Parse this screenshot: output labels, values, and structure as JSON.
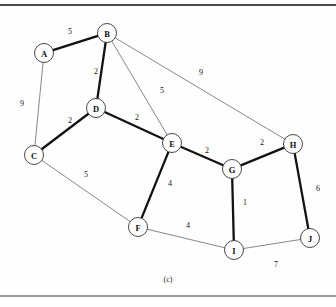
{
  "figure": {
    "caption": "(c)",
    "caption_x": 148,
    "caption_y": 275,
    "colors": {
      "background": "#fefefe",
      "thick_edge": "#121212",
      "thin_edge": "#555555",
      "node_fill": "#ffffff",
      "node_stroke": "#333333",
      "text": "#111111"
    }
  },
  "chart_data": {
    "type": "diagram",
    "subtype": "weighted-undirected-graph",
    "title": "(c)",
    "node_radius": 9.5,
    "nodes": [
      {
        "id": "A",
        "label": "A",
        "x": 44,
        "y": 53
      },
      {
        "id": "B",
        "label": "B",
        "x": 107,
        "y": 33
      },
      {
        "id": "C",
        "label": "C",
        "x": 34,
        "y": 155
      },
      {
        "id": "D",
        "label": "D",
        "x": 96,
        "y": 108
      },
      {
        "id": "E",
        "label": "E",
        "x": 172,
        "y": 143
      },
      {
        "id": "F",
        "label": "F",
        "x": 138,
        "y": 227
      },
      {
        "id": "G",
        "label": "G",
        "x": 232,
        "y": 169
      },
      {
        "id": "H",
        "label": "H",
        "x": 293,
        "y": 144
      },
      {
        "id": "I",
        "label": "I",
        "x": 234,
        "y": 250
      },
      {
        "id": "J",
        "label": "J",
        "x": 310,
        "y": 238
      }
    ],
    "edges": [
      {
        "source": "A",
        "target": "B",
        "weight": 5,
        "style": "thick",
        "label_x": 70,
        "label_y": 31
      },
      {
        "source": "A",
        "target": "C",
        "weight": 9,
        "style": "thin",
        "label_x": 22,
        "label_y": 103
      },
      {
        "source": "B",
        "target": "D",
        "weight": 2,
        "style": "thick",
        "label_x": 96,
        "label_y": 71
      },
      {
        "source": "B",
        "target": "E",
        "weight": 5,
        "style": "thin",
        "label_x": 162,
        "label_y": 90
      },
      {
        "source": "B",
        "target": "H",
        "weight": 9,
        "style": "thin",
        "label_x": 201,
        "label_y": 72
      },
      {
        "source": "C",
        "target": "D",
        "weight": 2,
        "style": "thick",
        "label_x": 70,
        "label_y": 120
      },
      {
        "source": "C",
        "target": "F",
        "weight": 5,
        "style": "thin",
        "label_x": 86,
        "label_y": 174
      },
      {
        "source": "D",
        "target": "E",
        "weight": 2,
        "style": "thick",
        "label_x": 137,
        "label_y": 117
      },
      {
        "source": "E",
        "target": "F",
        "weight": 4,
        "style": "thick",
        "label_x": 170,
        "label_y": 183
      },
      {
        "source": "E",
        "target": "G",
        "weight": 2,
        "style": "thick",
        "label_x": 207,
        "label_y": 150
      },
      {
        "source": "F",
        "target": "I",
        "weight": 4,
        "style": "thin",
        "label_x": 188,
        "label_y": 225
      },
      {
        "source": "G",
        "target": "H",
        "weight": 2,
        "style": "thick",
        "label_x": 262,
        "label_y": 142
      },
      {
        "source": "G",
        "target": "I",
        "weight": 1,
        "style": "thick",
        "label_x": 245,
        "label_y": 202
      },
      {
        "source": "H",
        "target": "J",
        "weight": 6,
        "style": "thick",
        "label_x": 318,
        "label_y": 188
      },
      {
        "source": "I",
        "target": "J",
        "weight": 7,
        "style": "thin",
        "label_x": 276,
        "label_y": 264
      }
    ],
    "legend": [],
    "xlabel": "",
    "ylabel": ""
  }
}
